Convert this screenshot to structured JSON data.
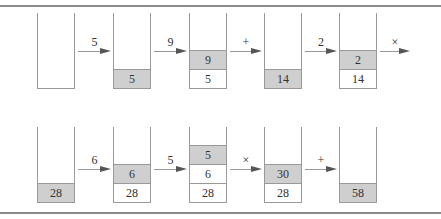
{
  "colors": {
    "top_cell": "#cfcfcf",
    "border": "#999999",
    "rule": "#8a8a8a"
  },
  "rows": [
    {
      "stacks": [
        {
          "cells": []
        },
        {
          "cells": [
            "5"
          ]
        },
        {
          "cells": [
            "5",
            "9"
          ]
        },
        {
          "cells": [
            "14"
          ]
        },
        {
          "cells": [
            "14",
            "2"
          ]
        }
      ],
      "arrows": [
        "5",
        "9",
        "+",
        "2",
        "×"
      ]
    },
    {
      "stacks": [
        {
          "cells": [
            "28"
          ]
        },
        {
          "cells": [
            "28",
            "6"
          ]
        },
        {
          "cells": [
            "28",
            "6",
            "5"
          ]
        },
        {
          "cells": [
            "28",
            "30"
          ]
        },
        {
          "cells": [
            "58"
          ]
        }
      ],
      "arrows": [
        "6",
        "5",
        "×",
        "+"
      ]
    }
  ]
}
